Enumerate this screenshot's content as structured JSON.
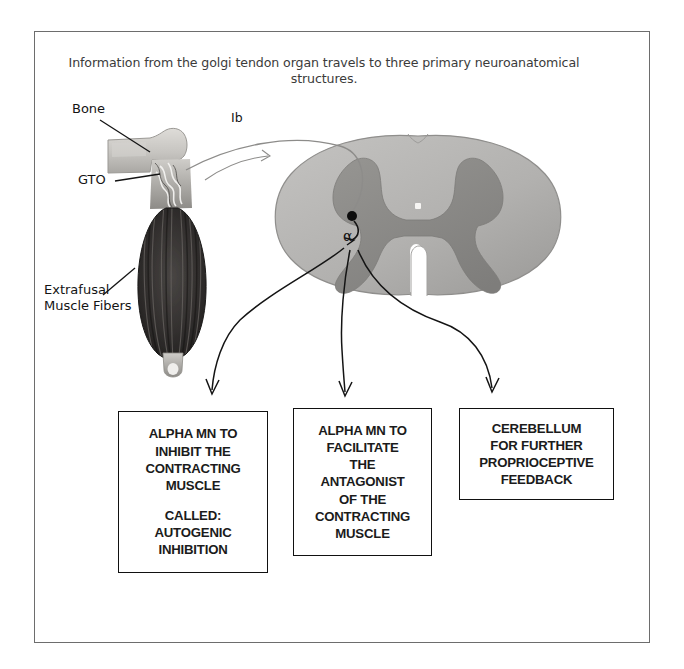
{
  "caption": {
    "text": "Information from the golgi tendon organ travels to three primary neuroanatomical structures."
  },
  "diagram": {
    "labels": {
      "bone": "Bone",
      "gto": "GTO",
      "extrafusal": "Extrafusal\nMuscle Fibers",
      "ib_afferent": "Ib",
      "alpha_motor_neuron": "α"
    }
  },
  "outputs": [
    {
      "name": "inhibit",
      "line1": "ALPHA MN TO\nINHIBIT THE\nCONTRACTING\nMUSCLE",
      "line2": "CALLED:\nAUTOGENIC\nINHIBITION"
    },
    {
      "name": "facilitate",
      "line1": "ALPHA MN TO\nFACILITATE\nTHE\nANTAGONIST\nOF THE\nCONTRACTING\nMUSCLE",
      "line2": ""
    },
    {
      "name": "cerebellum",
      "line1": "CEREBELLUM\nFOR FURTHER\nPROPRIOCEPTIVE\nFEEDBACK",
      "line2": ""
    }
  ],
  "colors": {
    "frame_border": "#6d6d6d",
    "box_border": "#111111",
    "caption_text": "#3b3b3b",
    "white_matter": "#b4b3b1",
    "gray_matter": "#8b8a88",
    "bone": "#c9c8c4",
    "muscle_dark": "#2e2c2b",
    "leader_line": "#111111",
    "afferent_line": "#8d8c8a"
  }
}
